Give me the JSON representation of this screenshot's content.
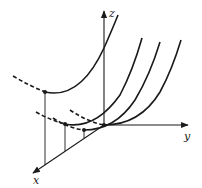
{
  "diagram": {
    "type": "3d-axes-with-parabolic-curves",
    "axes": {
      "x": {
        "label": "x"
      },
      "y": {
        "label": "y"
      },
      "z": {
        "label": "z"
      }
    },
    "curves": [
      {
        "name": "upper-parabola",
        "min_point_marked": true
      },
      {
        "name": "lower-parabola-1",
        "min_point_marked": true
      },
      {
        "name": "lower-parabola-2",
        "min_point_marked": true
      },
      {
        "name": "lower-parabola-3",
        "min_point_marked": true
      }
    ],
    "projection_lines": 3,
    "colors": {
      "stroke": "#1a1a1a",
      "background": "#ffffff"
    }
  }
}
